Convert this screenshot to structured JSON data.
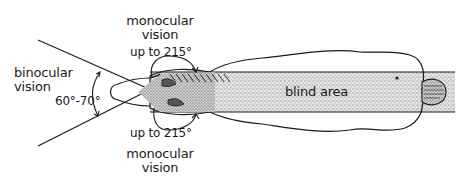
{
  "figure": {
    "labels": {
      "binocular": [
        "binocular",
        "vision"
      ],
      "binocular_angle": "60°-70°",
      "monocular_top": [
        "monocular",
        "vision"
      ],
      "monocular_top_angle": "up to 215°",
      "monocular_bottom_angle": "up to 215°",
      "monocular_bottom": [
        "monocular",
        "vision"
      ],
      "blind_area": "blind area"
    },
    "colors": {
      "ink": "#1a1a1a",
      "stipple_bg": "#d9d9d9",
      "background": "#ffffff"
    }
  }
}
